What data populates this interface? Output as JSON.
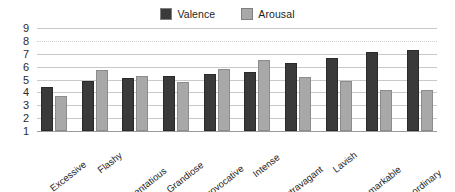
{
  "chart_data": {
    "type": "bar",
    "title": "",
    "subtitle": "",
    "xlabel": "",
    "ylabel": "",
    "ylim": [
      1,
      9
    ],
    "yticks": [
      9,
      8,
      7,
      6,
      5,
      4,
      3,
      2,
      1
    ],
    "grid": true,
    "legend_position": "top-center",
    "categories": [
      "Excessive",
      "Flashy",
      "Ostentatious",
      "Grandiose",
      "Provocative",
      "Intense",
      "Extravagant",
      "Lavish",
      "Remarkable",
      "Extraordinary"
    ],
    "series": [
      {
        "name": "Valence",
        "color": "#3a3a3a",
        "values": [
          4.4,
          4.85,
          5.1,
          5.25,
          5.4,
          5.6,
          6.25,
          6.7,
          7.1,
          7.3
        ]
      },
      {
        "name": "Arousal",
        "color": "#a8a8a8",
        "values": [
          3.75,
          5.75,
          5.25,
          4.8,
          5.85,
          6.5,
          5.2,
          4.85,
          4.2,
          4.15
        ]
      }
    ]
  },
  "legend": {
    "items": [
      {
        "label": "Valence",
        "color": "#3a3a3a"
      },
      {
        "label": "Arousal",
        "color": "#a8a8a8"
      }
    ]
  }
}
